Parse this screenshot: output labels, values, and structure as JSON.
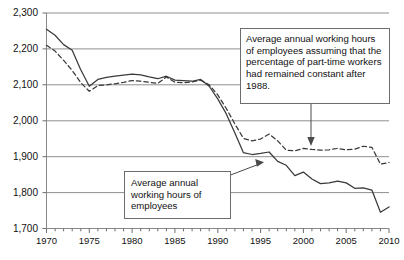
{
  "chart_data": {
    "type": "line",
    "title": "",
    "xlabel": "",
    "ylabel": "",
    "xlim": [
      1970,
      2010
    ],
    "ylim": [
      1700,
      2300
    ],
    "ytick_step": 100,
    "xtick_step": 5,
    "x_minor_tick_step": 1,
    "grid": true,
    "legend_position": "none (inline annotation boxes)",
    "yticks": [
      "1,700",
      "1,800",
      "1,900",
      "2,000",
      "2,100",
      "2,200",
      "2,300"
    ],
    "xticks": [
      "1970",
      "1975",
      "1980",
      "1985",
      "1990",
      "1995",
      "2000",
      "2005",
      "2010"
    ],
    "x": [
      1970,
      1971,
      1972,
      1973,
      1974,
      1975,
      1976,
      1977,
      1978,
      1979,
      1980,
      1981,
      1982,
      1983,
      1984,
      1985,
      1986,
      1987,
      1988,
      1989,
      1990,
      1991,
      1992,
      1993,
      1994,
      1995,
      1996,
      1997,
      1998,
      1999,
      2000,
      2001,
      2002,
      2003,
      2004,
      2005,
      2006,
      2007,
      2008,
      2009,
      2010
    ],
    "series": [
      {
        "name": "Average annual working hours of employees",
        "style": "solid",
        "color": "#3a3a3a",
        "values": [
          2255,
          2238,
          2212,
          2196,
          2142,
          2096,
          2115,
          2121,
          2124,
          2127,
          2130,
          2128,
          2122,
          2117,
          2124,
          2113,
          2112,
          2110,
          2115,
          2096,
          2061,
          2019,
          1966,
          1911,
          1906,
          1909,
          1913,
          1887,
          1876,
          1847,
          1857,
          1838,
          1825,
          1827,
          1832,
          1827,
          1812,
          1813,
          1807,
          1745,
          1760
        ]
      },
      {
        "name": "Average annual working hours of employees assuming that the percentage of part-time workers had remained constant after 1988",
        "style": "dashed",
        "color": "#3a3a3a",
        "values": [
          2210,
          2194,
          2168,
          2140,
          2106,
          2082,
          2098,
          2100,
          2103,
          2107,
          2112,
          2110,
          2107,
          2104,
          2122,
          2107,
          2106,
          2108,
          2113,
          2100,
          2072,
          2034,
          1991,
          1951,
          1944,
          1949,
          1963,
          1944,
          1918,
          1916,
          1923,
          1920,
          1918,
          1919,
          1923,
          1919,
          1921,
          1929,
          1926,
          1879,
          1884
        ]
      }
    ],
    "annotations": [
      {
        "name": "assumed-series-callout",
        "text": "Average annual working hours of employees assuming that the percentage of part-time workers had remained constant after 1988.",
        "arrow": "vertical-down-to-dashed-line"
      },
      {
        "name": "actual-series-callout",
        "text": "Average annual working hours of employees",
        "arrow": "diagonal-up-right-to-solid-line"
      }
    ]
  },
  "callouts": {
    "assumed": "Average annual working hours of employees assuming that the percentage of part-time workers had remained constant after 1988.",
    "actual": "Average annual working hours of employees"
  }
}
